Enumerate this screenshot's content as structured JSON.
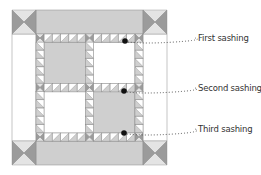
{
  "diagram": {
    "colors": {
      "border": "#cfcfcf",
      "dark": "#9b9b9b",
      "light": "#e4e4e4",
      "white": "#ffffff",
      "gray_block": "#cfcfcf",
      "outline": "#8a8a8a",
      "dot": "#111111",
      "leader": "#555555"
    },
    "quilt": {
      "x": 12,
      "y": 10,
      "size": 155,
      "corner": 24
    },
    "inner": {
      "x": 36,
      "y": 34,
      "size": 107,
      "sash": 8
    },
    "blocks": [
      {
        "row": 0,
        "col": 0,
        "fill": "gray"
      },
      {
        "row": 0,
        "col": 1,
        "fill": "white"
      },
      {
        "row": 1,
        "col": 0,
        "fill": "white"
      },
      {
        "row": 1,
        "col": 1,
        "fill": "gray"
      }
    ],
    "callouts": [
      {
        "label": "First sashing",
        "dot": [
          125,
          41
        ],
        "text": [
          198,
          33
        ]
      },
      {
        "label": "Second sashing",
        "dot": [
          124,
          91
        ],
        "text": [
          198,
          83
        ]
      },
      {
        "label": "Third sashing",
        "dot": [
          124,
          133
        ],
        "text": [
          198,
          124
        ]
      }
    ]
  }
}
